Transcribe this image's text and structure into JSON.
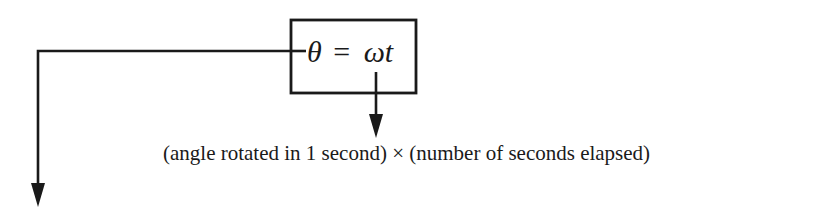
{
  "equation": {
    "lhs": "θ",
    "operator": "=",
    "rhs": "ωt"
  },
  "annotation": "(angle rotated in 1 second) × (number of seconds elapsed)",
  "colors": {
    "ink": "#1a1a1a",
    "background": "#ffffff"
  }
}
